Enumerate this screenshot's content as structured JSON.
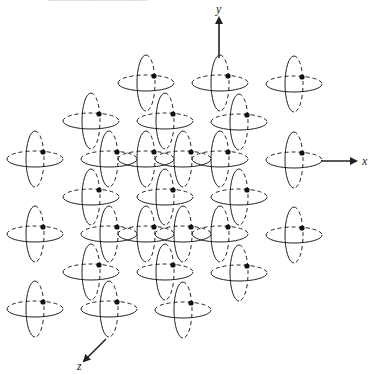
{
  "figure": {
    "type": "crystal-lattice-orbital-diagram",
    "caption_clipped": true
  },
  "axes": {
    "x": {
      "label": "x",
      "x1": 321,
      "y1": 161,
      "x2": 356,
      "y2": 161,
      "label_x": 362,
      "label_y": 165
    },
    "y": {
      "label": "y",
      "x1": 219,
      "y1": 58,
      "x2": 219,
      "y2": 18,
      "label_x": 216,
      "label_y": 13
    },
    "z": {
      "label": "z",
      "x1": 106,
      "y1": 339,
      "x2": 84,
      "y2": 361,
      "label_x": 77,
      "label_y": 370
    }
  },
  "atom_style": {
    "horizontal_rx": 28,
    "horizontal_ry": 8,
    "vertical_rx": 9,
    "vertical_ry": 28,
    "ellipse_offset_x": -8,
    "ellipse_offset_y": 7,
    "dot_radius": 2.6,
    "stroke": "#222222"
  },
  "atoms": [
    {
      "x": 154,
      "y": 76
    },
    {
      "x": 228,
      "y": 76
    },
    {
      "x": 302,
      "y": 77
    },
    {
      "x": 99,
      "y": 114
    },
    {
      "x": 173,
      "y": 114
    },
    {
      "x": 247,
      "y": 115
    },
    {
      "x": 43,
      "y": 152
    },
    {
      "x": 117,
      "y": 152
    },
    {
      "x": 154,
      "y": 152
    },
    {
      "x": 191,
      "y": 152
    },
    {
      "x": 228,
      "y": 152
    },
    {
      "x": 302,
      "y": 153
    },
    {
      "x": 99,
      "y": 190
    },
    {
      "x": 173,
      "y": 190
    },
    {
      "x": 247,
      "y": 190
    },
    {
      "x": 43,
      "y": 227
    },
    {
      "x": 117,
      "y": 227
    },
    {
      "x": 154,
      "y": 227
    },
    {
      "x": 191,
      "y": 227
    },
    {
      "x": 228,
      "y": 227
    },
    {
      "x": 302,
      "y": 228
    },
    {
      "x": 99,
      "y": 265
    },
    {
      "x": 173,
      "y": 265
    },
    {
      "x": 247,
      "y": 266
    },
    {
      "x": 43,
      "y": 302
    },
    {
      "x": 117,
      "y": 302
    },
    {
      "x": 191,
      "y": 303
    }
  ]
}
